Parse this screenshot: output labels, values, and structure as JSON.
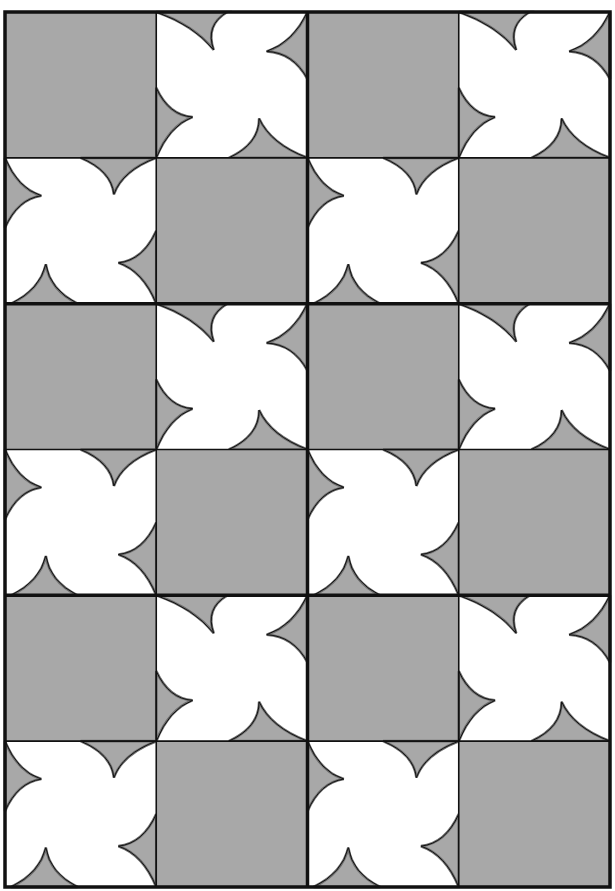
{
  "colors": {
    "background": "#ffffff",
    "gray": "#a8a8a8",
    "white": "#ffffff",
    "line": "#111111",
    "inner_line": "#6e6e6e"
  },
  "frame": {
    "x": 5,
    "y": 12,
    "width": 605,
    "height": 875,
    "border_width": 3.5
  },
  "grid": {
    "columns": 4,
    "rows": 6,
    "thick_vertical_lines_after_columns": [
      2
    ],
    "thick_horizontal_lines_after_rows": [
      2,
      4
    ],
    "thin_line_width": 1.6,
    "thick_line_width": 3.5
  },
  "cells": [
    [
      "gray",
      "pinwheel-a",
      "gray",
      "pinwheel-a"
    ],
    [
      "pinwheel-b",
      "gray",
      "pinwheel-b",
      "gray"
    ],
    [
      "gray",
      "pinwheel-a",
      "gray",
      "pinwheel-a"
    ],
    [
      "pinwheel-b",
      "gray",
      "pinwheel-b",
      "gray"
    ],
    [
      "gray",
      "pinwheel-a",
      "gray",
      "pinwheel-a"
    ],
    [
      "pinwheel-b",
      "gray",
      "pinwheel-b",
      "gray"
    ]
  ],
  "pinwheel_shapes": {
    "pinwheel-a": [
      {
        "edge": "top",
        "from": [
          0.0,
          0.0
        ],
        "to": [
          0.47,
          0.0
        ],
        "tip": [
          0.38,
          0.26
        ]
      },
      {
        "edge": "right",
        "from": [
          1.0,
          0.0
        ],
        "to": [
          1.0,
          0.46
        ],
        "tip": [
          0.73,
          0.27
        ]
      },
      {
        "edge": "left",
        "from": [
          0.0,
          0.52
        ],
        "to": [
          0.0,
          1.0
        ],
        "tip": [
          0.24,
          0.72
        ]
      },
      {
        "edge": "bottom",
        "from": [
          0.48,
          1.0
        ],
        "to": [
          1.0,
          1.0
        ],
        "tip": [
          0.68,
          0.73
        ]
      }
    ],
    "pinwheel-b": [
      {
        "edge": "top",
        "from": [
          0.5,
          0.0
        ],
        "to": [
          1.0,
          0.0
        ],
        "tip": [
          0.72,
          0.25
        ]
      },
      {
        "edge": "left",
        "from": [
          0.0,
          0.0
        ],
        "to": [
          0.0,
          0.48
        ],
        "tip": [
          0.24,
          0.26
        ]
      },
      {
        "edge": "right",
        "from": [
          1.0,
          0.5
        ],
        "to": [
          1.0,
          1.0
        ],
        "tip": [
          0.75,
          0.72
        ]
      },
      {
        "edge": "bottom",
        "from": [
          0.04,
          1.0
        ],
        "to": [
          0.48,
          1.0
        ],
        "tip": [
          0.27,
          0.73
        ]
      }
    ]
  }
}
